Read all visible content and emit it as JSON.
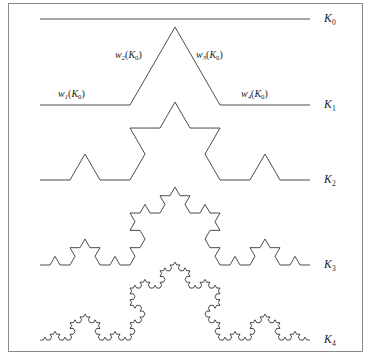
{
  "figure": {
    "frame": {
      "x": 8,
      "y": 3,
      "width": 355,
      "height": 349,
      "border_color": "#8a8a8a"
    },
    "canvas": {
      "width": 371,
      "height": 364
    },
    "line_color": "#2b2b2b",
    "background": "#ffffff"
  },
  "chart_data": {
    "type": "line",
    "xlabel": "",
    "ylabel": "",
    "generator": "koch",
    "segment_start_x": 40,
    "segment_end_x": 310,
    "stages": [
      {
        "name": "K0",
        "iteration": 0,
        "baseline_y": 19,
        "segments": 1
      },
      {
        "name": "K1",
        "iteration": 1,
        "baseline_y": 105,
        "segments": 4
      },
      {
        "name": "K2",
        "iteration": 2,
        "baseline_y": 180,
        "segments": 16
      },
      {
        "name": "K3",
        "iteration": 3,
        "baseline_y": 265,
        "segments": 64
      },
      {
        "name": "K4",
        "iteration": 4,
        "baseline_y": 340,
        "segments": 256
      }
    ]
  },
  "stage_labels": [
    {
      "id": "k0",
      "base": "K",
      "sub": "0",
      "x": 324,
      "y": 13
    },
    {
      "id": "k1",
      "base": "K",
      "sub": "1",
      "x": 324,
      "y": 99
    },
    {
      "id": "k2",
      "base": "K",
      "sub": "2",
      "x": 324,
      "y": 174
    },
    {
      "id": "k3",
      "base": "K",
      "sub": "3",
      "x": 324,
      "y": 259
    },
    {
      "id": "k4",
      "base": "K",
      "sub": "4",
      "x": 324,
      "y": 334
    }
  ],
  "map_labels": [
    {
      "id": "w1",
      "w": "w",
      "w_sub": "1",
      "open": "(",
      "k": "K",
      "k_sub": "0",
      "close": ")",
      "x": 58,
      "y": 89
    },
    {
      "id": "w2",
      "w": "w",
      "w_sub": "2",
      "open": "(",
      "k": "K",
      "k_sub": "0",
      "close": ")",
      "x": 115,
      "y": 50
    },
    {
      "id": "w3",
      "w": "w",
      "w_sub": "3",
      "open": "(",
      "k": "K",
      "k_sub": "0",
      "close": ")",
      "x": 196,
      "y": 50
    },
    {
      "id": "w4",
      "w": "w",
      "w_sub": "4",
      "open": "(",
      "k": "K",
      "k_sub": "0",
      "close": ")",
      "x": 241,
      "y": 89
    }
  ]
}
